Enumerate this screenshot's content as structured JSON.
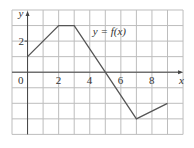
{
  "chart_data": {
    "type": "line",
    "title": "",
    "annotation": "y = f(x)",
    "xlabel": "x",
    "ylabel": "y",
    "x_ticks": [
      {
        "value": 0,
        "label": "0"
      },
      {
        "value": 2,
        "label": "2"
      },
      {
        "value": 4,
        "label": "4"
      },
      {
        "value": 6,
        "label": "6"
      },
      {
        "value": 8,
        "label": "8"
      }
    ],
    "y_ticks": [
      {
        "value": 2,
        "label": "2"
      }
    ],
    "xlim": [
      -1,
      10
    ],
    "ylim": [
      -4,
      4
    ],
    "grid": true,
    "series": [
      {
        "name": "f(x)",
        "x": [
          0,
          2,
          3,
          5,
          7,
          9
        ],
        "y": [
          1,
          3,
          3,
          0,
          -3,
          -2
        ]
      }
    ]
  },
  "colors": {
    "line": "#555555",
    "grid": "#bdbdbd",
    "frame": "#bdbdbd",
    "axis": "#444444"
  }
}
